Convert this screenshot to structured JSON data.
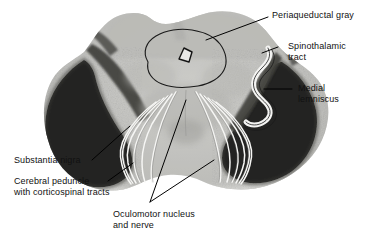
{
  "figure": {
    "kind": "anatomical-cross-section",
    "background_color": "#ffffff",
    "label_text_color": "#111111",
    "leader_line_color": "#000000",
    "tract_outline_color": "#f2f2f2",
    "specimen_colors": {
      "light_gray_tegmentum": "#c9c9c7",
      "mid_gray": "#a9a9a6",
      "dark_band": "#3b3b39",
      "black_peduncle": "#141414",
      "pale_base": "#efefec"
    }
  },
  "labels": {
    "periaqueductal_gray": "Periaqueductal gray",
    "spinothalamic_tract_line1": "Spinothalamic",
    "spinothalamic_tract_line2": "tract",
    "medial_lemniscus_line1": "Medial",
    "medial_lemniscus_line2": "lemniscus",
    "substantia_nigra": "Substantia nigra",
    "cerebral_peduncle_line1": "Cerebral peduncle",
    "cerebral_peduncle_line2": "with corticospinal tracts",
    "oculomotor_line1": "Oculomotor nucleus",
    "oculomotor_line2": "and nerve"
  },
  "structures": [
    {
      "name": "periaqueductal-gray",
      "label": "Periaqueductal gray"
    },
    {
      "name": "cerebral-aqueduct",
      "label": "Cerebral aqueduct"
    },
    {
      "name": "spinothalamic-tract",
      "label": "Spinothalamic tract"
    },
    {
      "name": "medial-lemniscus",
      "label": "Medial lemniscus"
    },
    {
      "name": "substantia-nigra",
      "label": "Substantia nigra"
    },
    {
      "name": "cerebral-peduncle",
      "label": "Cerebral peduncle with corticospinal tracts"
    },
    {
      "name": "oculomotor-nucleus-and-nerve",
      "label": "Oculomotor nucleus and nerve"
    }
  ]
}
